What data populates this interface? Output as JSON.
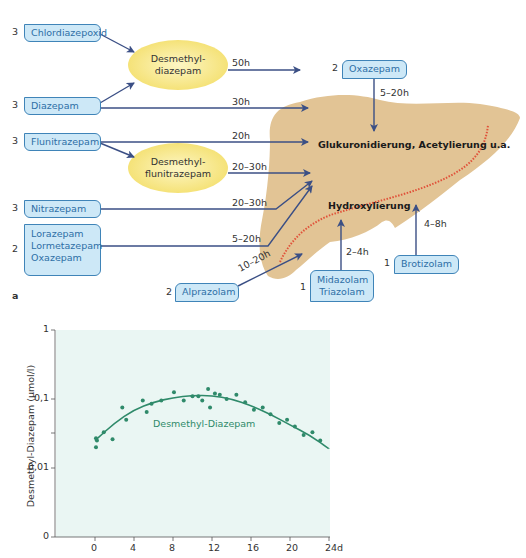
{
  "figure_a": {
    "panel_label": "a",
    "sources": [
      {
        "name": "Chlordiazepoxid",
        "class": "3"
      },
      {
        "name": "Diazepam",
        "class": "3"
      },
      {
        "name": "Flunitrazepam",
        "class": "3"
      },
      {
        "name": "Nitrazepam",
        "class": "3"
      },
      {
        "name": "Lorazepam",
        "class": "2"
      },
      {
        "name": "Lormetazepam",
        "class": ""
      },
      {
        "name": "Oxazepam",
        "class": ""
      },
      {
        "name": "Alprazolam",
        "class": "2"
      },
      {
        "name": "Midazolam",
        "class": "1"
      },
      {
        "name": "Triazolam",
        "class": ""
      },
      {
        "name": "Brotizolam",
        "class": "1"
      }
    ],
    "oxazepam_top": {
      "name": "Oxazepam",
      "class": "2",
      "halflife": "5–20h"
    },
    "metabolites": {
      "desmethyl_diazepam_line1": "Desmethyl-",
      "desmethyl_diazepam_line2": "diazepam",
      "desmethyl_flunitrazepam_line1": "Desmethyl-",
      "desmethyl_flunitrazepam_line2": "flunitrazepam"
    },
    "halflives": {
      "desmethyl_diazepam": "50h",
      "diazepam": "30h",
      "flunitrazepam": "20h",
      "desmethyl_flunitrazepam": "20–30h",
      "nitrazepam": "20–30h",
      "lorazepam_group": "5–20h",
      "alprazolam": "10–20h",
      "midazolam_group": "2–4h",
      "brotizolam": "4–8h"
    },
    "liver_labels": {
      "upper": "Glukuronidierung, Acetylierung u.a.",
      "lower": "Hydroxylierung"
    },
    "colors": {
      "box_fill": "#cde8f7",
      "box_border": "#3f84b8",
      "box_text": "#2e6fa6",
      "ellipse_fill": "#f7ea84",
      "liver_fill": "#e2c495",
      "arrow": "#3b4f85",
      "dotted_line": "#e0523a"
    }
  },
  "chart_data": {
    "type": "scatter",
    "title": "",
    "xlabel": "",
    "ylabel": "Desmethyl-Diazepam (µmol/l)",
    "x_ticks": [
      "0",
      "4",
      "8",
      "12",
      "16",
      "20",
      "24d"
    ],
    "x_tick_values": [
      0,
      4,
      8,
      12,
      16,
      20,
      24
    ],
    "y_ticks": [
      "0",
      "0,01",
      "0,1",
      "1"
    ],
    "y_scale": "log",
    "xlim": [
      -4,
      24
    ],
    "ylim": [
      0.001,
      1
    ],
    "grid": false,
    "series": [
      {
        "name": "Desmethyl-Diazepam",
        "kind": "points",
        "x": [
          0.1,
          0.1,
          0.2,
          0.9,
          1.8,
          2.8,
          3.2,
          4.9,
          5.3,
          5.8,
          6.8,
          8.1,
          9.1,
          10.0,
          10.6,
          11.0,
          11.6,
          11.8,
          12.3,
          12.8,
          13.5,
          14.5,
          15.4,
          16.3,
          17.2,
          18.0,
          18.9,
          19.7,
          20.5,
          21.4,
          22.3,
          23.1
        ],
        "y": [
          0.027,
          0.02,
          0.025,
          0.033,
          0.026,
          0.075,
          0.05,
          0.095,
          0.065,
          0.085,
          0.095,
          0.125,
          0.095,
          0.11,
          0.11,
          0.095,
          0.14,
          0.075,
          0.12,
          0.115,
          0.1,
          0.115,
          0.09,
          0.07,
          0.075,
          0.06,
          0.045,
          0.05,
          0.04,
          0.03,
          0.033,
          0.025
        ]
      },
      {
        "name": "Desmethyl-Diazepam fit",
        "kind": "line",
        "x": [
          0,
          2,
          4,
          6,
          8,
          10,
          12,
          14,
          16,
          18,
          20,
          22,
          24
        ],
        "y": [
          0.025,
          0.045,
          0.07,
          0.09,
          0.105,
          0.113,
          0.112,
          0.1,
          0.08,
          0.06,
          0.042,
          0.03,
          0.019
        ]
      }
    ],
    "annotations": [
      {
        "text": "Desmethyl-Diazepam",
        "x": 10,
        "y": 0.05
      }
    ],
    "colors": {
      "series": "#2f8a6a",
      "plot_bg": "#eaf6f3"
    }
  }
}
